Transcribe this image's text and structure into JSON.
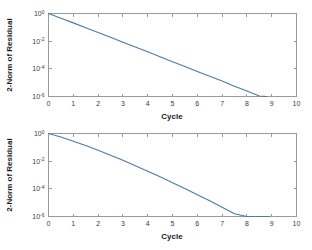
{
  "figure": {
    "background": "#ffffff",
    "line_color": "#4a7aa8",
    "axis_color": "#9a9a9a"
  },
  "chart_data": [
    {
      "type": "line",
      "title": "",
      "xlabel": "Cycle",
      "ylabel": "2-Norm of Residual",
      "xlim": [
        0,
        10
      ],
      "ylim": [
        1e-06,
        1
      ],
      "yscale": "log",
      "xscale": "linear",
      "grid": false,
      "legend": null,
      "xticks": [
        0,
        1,
        2,
        3,
        4,
        5,
        6,
        7,
        8,
        9,
        10
      ],
      "xticklabels": [
        "0",
        "1",
        "2",
        "3",
        "4",
        "5",
        "6",
        "7",
        "8",
        "9",
        "10"
      ],
      "yticks": [
        1,
        0.01,
        0.0001,
        1e-06
      ],
      "yticklabels": [
        "10^0",
        "10^-2",
        "10^-4",
        "10^-6"
      ],
      "ytick_mantissa": [
        "10",
        "10",
        "10",
        "10"
      ],
      "ytick_exponent": [
        "0",
        "-2",
        "-4",
        "-6"
      ],
      "series": [
        {
          "name": "residual",
          "x": [
            0,
            0.5,
            1,
            1.5,
            2,
            2.5,
            3,
            3.5,
            4,
            4.5,
            5,
            5.5,
            6,
            6.5,
            7,
            7.5,
            8,
            8.5,
            8.8
          ],
          "y": [
            1.0,
            0.46,
            0.21,
            0.094,
            0.042,
            0.019,
            0.0085,
            0.0038,
            0.0017,
            0.00075,
            0.00033,
            0.00015,
            6.5e-05,
            2.9e-05,
            1.3e-05,
            5.6e-06,
            2.5e-06,
            1.1e-06,
            1e-06
          ]
        }
      ]
    },
    {
      "type": "line",
      "title": "",
      "xlabel": "Cycle",
      "ylabel": "2-Norm of Residual",
      "xlim": [
        0,
        10
      ],
      "ylim": [
        1e-06,
        1
      ],
      "yscale": "log",
      "xscale": "linear",
      "grid": false,
      "legend": null,
      "xticks": [
        0,
        1,
        2,
        3,
        4,
        5,
        6,
        7,
        8,
        9,
        10
      ],
      "xticklabels": [
        "0",
        "1",
        "2",
        "3",
        "4",
        "5",
        "6",
        "7",
        "8",
        "9",
        "10"
      ],
      "yticks": [
        1,
        0.01,
        0.0001,
        1e-06
      ],
      "yticklabels": [
        "10^0",
        "10^-2",
        "10^-4",
        "10^-6"
      ],
      "ytick_mantissa": [
        "10",
        "10",
        "10",
        "10"
      ],
      "ytick_exponent": [
        "0",
        "-2",
        "-4",
        "-6"
      ],
      "series": [
        {
          "name": "residual",
          "x": [
            0,
            0.5,
            1,
            1.5,
            2,
            2.5,
            3,
            3.5,
            4,
            4.5,
            5,
            5.5,
            6,
            6.5,
            7,
            7.5,
            8,
            8.5,
            8.9
          ],
          "y": [
            1.0,
            0.55,
            0.28,
            0.135,
            0.062,
            0.027,
            0.0115,
            0.0047,
            0.0019,
            0.00074,
            0.00028,
            0.000105,
            3.8e-05,
            1.35e-05,
            4.7e-06,
            1.6e-06,
            5.4e-07,
            1.8e-07,
            1e-06
          ]
        }
      ]
    }
  ]
}
